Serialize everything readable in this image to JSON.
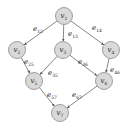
{
  "diagram": {
    "type": "directed-graph",
    "nodes": [
      {
        "id": "v1",
        "label": "v",
        "sub": "1",
        "x": 64,
        "y": 16
      },
      {
        "id": "v2",
        "label": "v",
        "sub": "2",
        "x": 17,
        "y": 50
      },
      {
        "id": "v3",
        "label": "v",
        "sub": "3",
        "x": 63,
        "y": 50
      },
      {
        "id": "v4",
        "label": "v",
        "sub": "4",
        "x": 111,
        "y": 50
      },
      {
        "id": "v5",
        "label": "v",
        "sub": "5",
        "x": 34,
        "y": 81
      },
      {
        "id": "v6",
        "label": "v",
        "sub": "6",
        "x": 104,
        "y": 81
      },
      {
        "id": "v7",
        "label": "v",
        "sub": "7",
        "x": 60,
        "y": 113
      }
    ],
    "edges": [
      {
        "id": "e12",
        "from": "v1",
        "to": "v2",
        "label": "e",
        "sub": "12",
        "lx": 33,
        "ly": 31
      },
      {
        "id": "e13",
        "from": "v1",
        "to": "v3",
        "label": "e",
        "sub": "13",
        "lx": 68,
        "ly": 36
      },
      {
        "id": "e14",
        "from": "v1",
        "to": "v4",
        "label": "e",
        "sub": "14",
        "lx": 92,
        "ly": 30
      },
      {
        "id": "e25",
        "from": "v2",
        "to": "v5",
        "label": "e",
        "sub": "25",
        "lx": 24,
        "ly": 64
      },
      {
        "id": "e35",
        "from": "v3",
        "to": "v5",
        "label": "e",
        "sub": "35",
        "lx": 48,
        "ly": 75
      },
      {
        "id": "e36",
        "from": "v3",
        "to": "v6",
        "label": "e",
        "sub": "36",
        "lx": 78,
        "ly": 64
      },
      {
        "id": "e46",
        "from": "v4",
        "to": "v6",
        "label": "e",
        "sub": "46",
        "lx": 110,
        "ly": 72
      },
      {
        "id": "e57",
        "from": "v5",
        "to": "v7",
        "label": "e",
        "sub": "57",
        "lx": 47,
        "ly": 97
      },
      {
        "id": "e67",
        "from": "v6",
        "to": "v7",
        "label": "e",
        "sub": "67",
        "lx": 72,
        "ly": 97
      }
    ],
    "node_radius": 8.5,
    "colors": {
      "node_fill": "#d9d9d9",
      "node_stroke": "#8c8c8c",
      "edge": "#555555"
    }
  }
}
